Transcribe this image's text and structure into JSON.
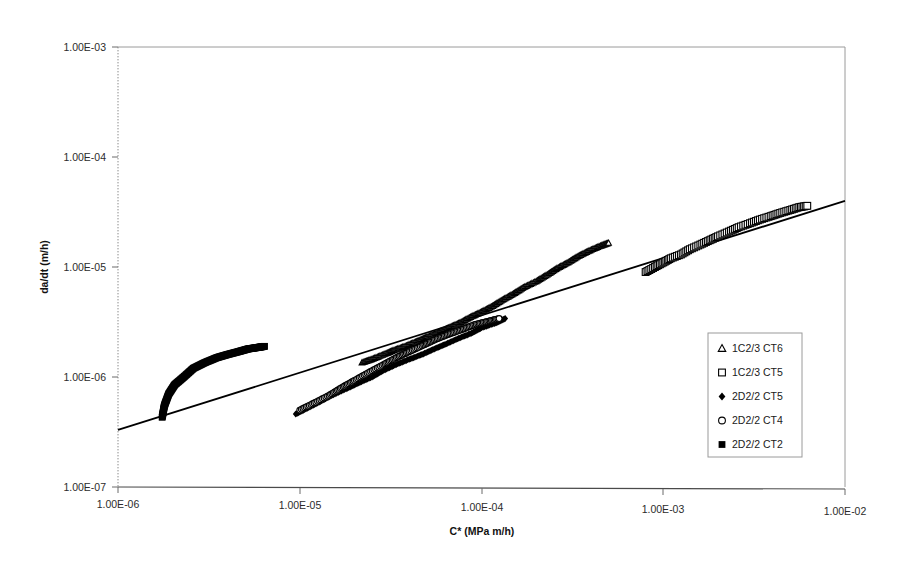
{
  "chart_data": {
    "type": "scatter",
    "title": "",
    "xlabel": "C* (MPa m/h)",
    "ylabel": "da/dt (m/h)",
    "xscale": "log",
    "yscale": "log",
    "xlim": [
      1e-06,
      0.01
    ],
    "ylim": [
      1e-07,
      0.001
    ],
    "xticks": [
      1e-06,
      1e-05,
      0.0001,
      0.001,
      0.01
    ],
    "xtick_labels": [
      "1.00E-06",
      "1.00E-05",
      "1.00E-04",
      "1.00E-03",
      "1.00E-02"
    ],
    "yticks": [
      1e-07,
      1e-06,
      1e-05,
      0.0001,
      0.001
    ],
    "ytick_labels": [
      "1.00E-07",
      "1.00E-06",
      "1.00E-05",
      "1.00E-04",
      "1.00E-03"
    ],
    "grid": false,
    "legend_position": "center-right",
    "series": [
      {
        "name": "1C2/3 CT6",
        "marker": "open-triangle",
        "color": "#000000",
        "points": [
          [
            2.2e-05,
            1.35e-06
          ],
          [
            2.5e-05,
            1.45e-06
          ],
          [
            2.9e-05,
            1.6e-06
          ],
          [
            3.3e-05,
            1.75e-06
          ],
          [
            3.8e-05,
            1.9e-06
          ],
          [
            4.4e-05,
            2.1e-06
          ],
          [
            5e-05,
            2.3e-06
          ],
          [
            5.8e-05,
            2.55e-06
          ],
          [
            6.6e-05,
            2.8e-06
          ],
          [
            7.6e-05,
            3.1e-06
          ],
          [
            8.7e-05,
            3.5e-06
          ],
          [
            0.0001,
            3.9e-06
          ],
          [
            0.000115,
            4.4e-06
          ],
          [
            0.00013,
            5e-06
          ],
          [
            0.00015,
            5.7e-06
          ],
          [
            0.00017,
            6.5e-06
          ],
          [
            0.0002,
            7.4e-06
          ],
          [
            0.00023,
            8.5e-06
          ],
          [
            0.00026,
            9.7e-06
          ],
          [
            0.0003,
            1.1e-05
          ],
          [
            0.00034,
            1.25e-05
          ],
          [
            0.00039,
            1.4e-05
          ],
          [
            0.00045,
            1.55e-05
          ],
          [
            0.0005,
            1.65e-05
          ]
        ]
      },
      {
        "name": "1C2/3 CT5",
        "marker": "open-square",
        "color": "#000000",
        "points": [
          [
            0.0008,
            9e-06
          ],
          [
            0.0009,
            1e-05
          ],
          [
            0.001,
            1.1e-05
          ],
          [
            0.0011,
            1.2e-05
          ],
          [
            0.00125,
            1.3e-05
          ],
          [
            0.0014,
            1.45e-05
          ],
          [
            0.0016,
            1.6e-05
          ],
          [
            0.0018,
            1.75e-05
          ],
          [
            0.002,
            1.9e-05
          ],
          [
            0.0023,
            2.1e-05
          ],
          [
            0.0026,
            2.3e-05
          ],
          [
            0.003,
            2.5e-05
          ],
          [
            0.0034,
            2.7e-05
          ],
          [
            0.0039,
            2.9e-05
          ],
          [
            0.0044,
            3.1e-05
          ],
          [
            0.005,
            3.3e-05
          ],
          [
            0.0056,
            3.5e-05
          ],
          [
            0.0062,
            3.6e-05
          ]
        ]
      },
      {
        "name": "2D2/2 CT5",
        "marker": "filled-diamond",
        "color": "#000000",
        "points": [
          [
            9.5e-06,
            4.6e-07
          ],
          [
            1.1e-05,
            5.2e-07
          ],
          [
            1.3e-05,
            6e-07
          ],
          [
            1.5e-05,
            6.8e-07
          ],
          [
            1.8e-05,
            7.8e-07
          ],
          [
            2.1e-05,
            8.8e-07
          ],
          [
            2.5e-05,
            1e-06
          ],
          [
            2.9e-05,
            1.15e-06
          ],
          [
            3.4e-05,
            1.3e-06
          ],
          [
            4e-05,
            1.45e-06
          ],
          [
            4.7e-05,
            1.6e-06
          ],
          [
            5.5e-05,
            1.8e-06
          ],
          [
            6.4e-05,
            2e-06
          ],
          [
            7.5e-05,
            2.25e-06
          ],
          [
            8.8e-05,
            2.5e-06
          ],
          [
            0.0001,
            2.8e-06
          ],
          [
            0.00012,
            3.1e-06
          ],
          [
            0.000135,
            3.4e-06
          ]
        ]
      },
      {
        "name": "2D2/2 CT4",
        "marker": "open-circle",
        "color": "#000000",
        "points": [
          [
            1e-05,
            5e-07
          ],
          [
            1.2e-05,
            5.8e-07
          ],
          [
            1.45e-05,
            6.8e-07
          ],
          [
            1.7e-05,
            8e-07
          ],
          [
            2e-05,
            9.3e-07
          ],
          [
            2.4e-05,
            1.1e-06
          ],
          [
            2.9e-05,
            1.3e-06
          ],
          [
            3.4e-05,
            1.5e-06
          ],
          [
            4e-05,
            1.7e-06
          ],
          [
            4.8e-05,
            1.95e-06
          ],
          [
            5.6e-05,
            2.2e-06
          ],
          [
            6.6e-05,
            2.45e-06
          ],
          [
            7.8e-05,
            2.7e-06
          ],
          [
            9.2e-05,
            3e-06
          ],
          [
            0.000108,
            3.2e-06
          ],
          [
            0.000125,
            3.4e-06
          ]
        ]
      },
      {
        "name": "2D2/2 CT2",
        "marker": "filled-square",
        "color": "#000000",
        "points": [
          [
            1.75e-06,
            4.3e-07
          ],
          [
            1.8e-06,
            5.5e-07
          ],
          [
            1.9e-06,
            7e-07
          ],
          [
            2.05e-06,
            8.5e-07
          ],
          [
            2.3e-06,
            1e-06
          ],
          [
            2.6e-06,
            1.2e-06
          ],
          [
            3e-06,
            1.35e-06
          ],
          [
            3.5e-06,
            1.5e-06
          ],
          [
            4e-06,
            1.6e-06
          ],
          [
            4.6e-06,
            1.7e-06
          ],
          [
            5.2e-06,
            1.8e-06
          ],
          [
            5.8e-06,
            1.85e-06
          ],
          [
            6.4e-06,
            1.9e-06
          ]
        ]
      }
    ],
    "trendline": {
      "name": "power-law fit",
      "color": "#000000",
      "x_start": 1e-06,
      "y_start": 3.3e-07,
      "x_end": 0.01,
      "y_end": 4e-05
    },
    "annotations": []
  },
  "legend": {
    "entries": [
      {
        "marker": "open-triangle",
        "label": "1C2/3 CT6"
      },
      {
        "marker": "open-square",
        "label": "1C2/3 CT5"
      },
      {
        "marker": "filled-diamond",
        "label": "2D2/2 CT5"
      },
      {
        "marker": "open-circle",
        "label": "2D2/2 CT4"
      },
      {
        "marker": "filled-square",
        "label": "2D2/2 CT2"
      }
    ]
  },
  "axes": {
    "x_title": "C* (MPa m/h)",
    "y_title": "da/dt (m/h)",
    "x_labels": [
      "1.00E-06",
      "1.00E-05",
      "1.00E-04",
      "1.00E-03",
      "1.00E-02"
    ],
    "y_labels": [
      "1.00E-03",
      "1.00E-04",
      "1.00E-05",
      "1.00E-06",
      "1.00E-07"
    ]
  },
  "colors": {
    "frame": "#9a9a9a",
    "data": "#000000",
    "text": "#1a1a1a",
    "background": "#ffffff"
  }
}
